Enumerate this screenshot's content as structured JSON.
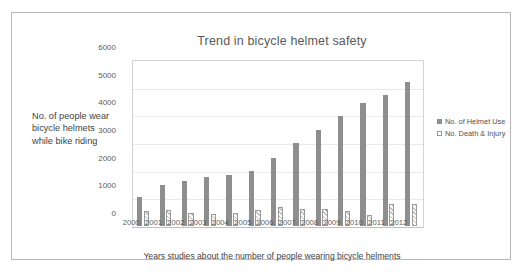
{
  "chart_data": {
    "type": "bar",
    "title": "Trend in bicycle helmet safety",
    "xlabel": "Years studies about the number of people wearing bicycle helments",
    "ylabel": "No. of people wear bicycle helmets while bike riding",
    "categories": [
      "2000",
      "2001",
      "2002",
      "2003",
      "2004",
      "2005",
      "2006",
      "2007",
      "2008",
      "2009",
      "2010",
      "2011",
      "2012"
    ],
    "series": [
      {
        "name": "No. of Helmet Use",
        "color": "#8e8e8e",
        "values": [
          1050,
          1470,
          1620,
          1760,
          1860,
          1980,
          2470,
          2990,
          3460,
          3970,
          4460,
          4735,
          5200
        ]
      },
      {
        "name": "No. Death & Injury",
        "color": "#ffffff",
        "values": [
          560,
          570,
          480,
          430,
          470,
          570,
          670,
          620,
          630,
          540,
          410,
          790,
          780
        ]
      }
    ],
    "ylim": [
      0,
      6000
    ],
    "yticks": [
      0,
      1000,
      2000,
      3000,
      4000,
      5000,
      6000
    ],
    "ytick_labels": [
      "0",
      "1000",
      "2000",
      "3000",
      "4000",
      "5000",
      "6000"
    ],
    "grid": true,
    "legend_position": "right"
  },
  "legend": {
    "entries": [
      {
        "label": "No. of Helmet Use"
      },
      {
        "label": "No. Death & Injury"
      }
    ]
  }
}
